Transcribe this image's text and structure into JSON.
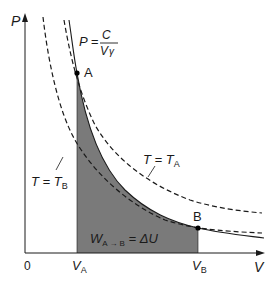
{
  "diagram": {
    "axes": {
      "y_label": "P",
      "x_label": "V",
      "origin_label": "0"
    },
    "points": {
      "A": {
        "label": "A",
        "x_tick": "V",
        "x_tick_sub": "A"
      },
      "B": {
        "label": "B",
        "x_tick": "V",
        "x_tick_sub": "B"
      }
    },
    "equation": {
      "lhs": "P =",
      "numerator": "C",
      "denominator": "V",
      "exponent": "γ"
    },
    "isotherms": [
      {
        "label": "T = T",
        "sub": "A"
      },
      {
        "label": "T = T",
        "sub": "B"
      }
    ],
    "area_label": {
      "w": "W",
      "w_sub": "A → B",
      "rhs": " = ΔU"
    },
    "colors": {
      "shaded_area": "#7a7a7a",
      "lines": "#1a1a1a",
      "background": "#ffffff"
    }
  }
}
